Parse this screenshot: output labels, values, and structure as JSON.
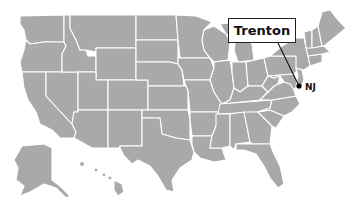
{
  "map": {
    "region": "United States",
    "fill_color": "#a9a9a9",
    "border_color": "#ffffff",
    "highlight": {
      "state": "NJ",
      "city": "Trenton",
      "marker_color": "#000000"
    }
  },
  "callout": {
    "label": "Trenton"
  },
  "state_label": "NJ"
}
